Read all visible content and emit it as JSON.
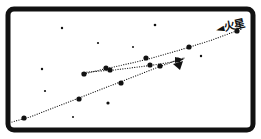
{
  "figure": {
    "type": "astronomical-diagram",
    "canvas": {
      "width": 261,
      "height": 139
    },
    "background_color": "#ffffff",
    "ink_color": "#111111",
    "frame": {
      "name": "panel-border",
      "x": 8,
      "y": 9,
      "width": 245,
      "height": 121,
      "stroke_color": "#111111",
      "stroke_width": 5,
      "corner_radius": 6,
      "fill_color": "#ffffff"
    }
  },
  "annotations": {
    "mars_label": {
      "text": "火星",
      "reading": "Mars",
      "arrow_glyph": "◄",
      "x": 216,
      "y": 24,
      "rotation_deg": -13,
      "color": "#111111"
    }
  },
  "chart_data": {
    "type": "scatter",
    "title": "火星",
    "xlabel": "",
    "ylabel": "",
    "xlim": [
      0,
      261
    ],
    "ylim": [
      139,
      0
    ],
    "grid": false,
    "legend": "none",
    "series": [
      {
        "name": "mars-track-outbound",
        "style": "dotted-path",
        "dot_color": "#111111",
        "points": [
          [
            12,
            122
          ],
          [
            30,
            117
          ],
          [
            48,
            110
          ],
          [
            66,
            103
          ],
          [
            84,
            96
          ],
          [
            102,
            89
          ],
          [
            120,
            82
          ],
          [
            138,
            75
          ],
          [
            156,
            68
          ],
          [
            172,
            62
          ],
          [
            184,
            58
          ]
        ],
        "marker_points": [
          [
            24,
            118
          ],
          [
            79,
            99
          ],
          [
            121,
            83
          ],
          [
            160,
            66
          ]
        ]
      },
      {
        "name": "mars-track-retrograde",
        "style": "dotted-path",
        "dot_color": "#111111",
        "points": [
          [
            184,
            58
          ],
          [
            180,
            60
          ],
          [
            172,
            62
          ],
          [
            160,
            64
          ],
          [
            146,
            66
          ],
          [
            130,
            68
          ],
          [
            114,
            70
          ],
          [
            100,
            71
          ],
          [
            88,
            72
          ],
          [
            82,
            73
          ]
        ],
        "marker_points": [
          [
            84,
            74
          ],
          [
            110,
            70
          ],
          [
            150,
            65
          ],
          [
            178,
            60
          ]
        ]
      },
      {
        "name": "mars-track-inbound",
        "style": "dotted-path",
        "dot_color": "#111111",
        "points": [
          [
            84,
            74
          ],
          [
            100,
            70
          ],
          [
            118,
            66
          ],
          [
            136,
            62
          ],
          [
            152,
            58
          ],
          [
            166,
            54
          ],
          [
            180,
            50
          ],
          [
            196,
            45
          ],
          [
            212,
            40
          ],
          [
            228,
            34
          ],
          [
            242,
            29
          ]
        ],
        "marker_points": [
          [
            106,
            68
          ],
          [
            146,
            58
          ],
          [
            189,
            47
          ],
          [
            237,
            31
          ]
        ]
      }
    ],
    "background_stars": [
      {
        "x": 62,
        "y": 28,
        "r": 1.2
      },
      {
        "x": 98,
        "y": 43,
        "r": 1.1
      },
      {
        "x": 155,
        "y": 25,
        "r": 1.3
      },
      {
        "x": 42,
        "y": 69,
        "r": 1.2
      },
      {
        "x": 45,
        "y": 91,
        "r": 1.1
      },
      {
        "x": 108,
        "y": 103,
        "r": 1.6
      },
      {
        "x": 201,
        "y": 56,
        "r": 1.2
      },
      {
        "x": 133,
        "y": 47,
        "r": 1.0
      },
      {
        "x": 73,
        "y": 117,
        "r": 1.0
      }
    ]
  }
}
